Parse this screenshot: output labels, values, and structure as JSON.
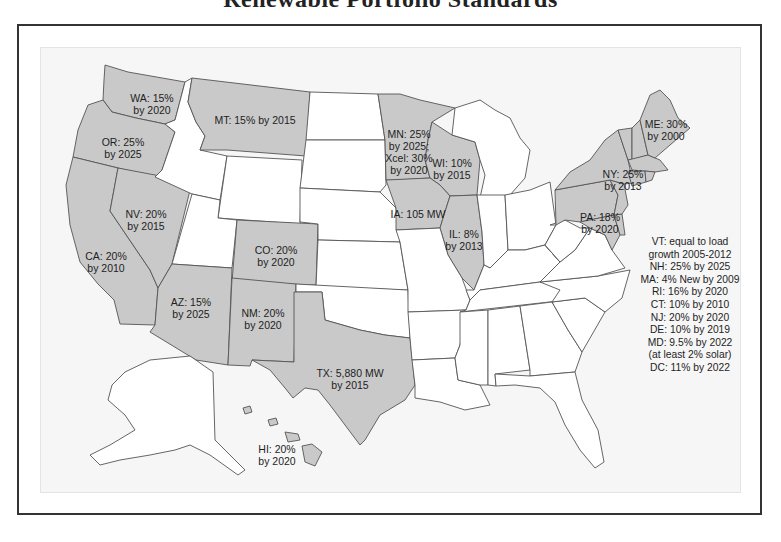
{
  "title": "Renewable Portfolio Standards",
  "colors": {
    "rps_state_fill": "#c9c9c9",
    "no_rps_state_fill": "#ffffff",
    "background": "#f6f6f6",
    "border": "#555555"
  },
  "state_labels": {
    "WA": {
      "line1": "WA: 15%",
      "line2": "by 2020"
    },
    "OR": {
      "line1": "OR: 25%",
      "line2": "by 2025"
    },
    "MT": {
      "line1": "MT: 15% by 2015",
      "line2": ""
    },
    "NV": {
      "line1": "NV: 20%",
      "line2": "by 2015"
    },
    "CA": {
      "line1": "CA: 20%",
      "line2": "by 2010"
    },
    "CO": {
      "line1": "CO: 20%",
      "line2": "by 2020"
    },
    "AZ": {
      "line1": "AZ: 15%",
      "line2": "by 2025"
    },
    "NM": {
      "line1": "NM: 20%",
      "line2": "by 2020"
    },
    "TX": {
      "line1": "TX: 5,880 MW",
      "line2": "by 2015"
    },
    "MN": {
      "line1": "MN: 25%",
      "line2": "by 2025;",
      "line3": "Xcel: 30%",
      "line4": "by 2020"
    },
    "WI": {
      "line1": "WI: 10%",
      "line2": "by 2015"
    },
    "IA": {
      "line1": "IA: 105 MW",
      "line2": ""
    },
    "IL": {
      "line1": "IL: 8%",
      "line2": "by 2013"
    },
    "ME": {
      "line1": "ME: 30%",
      "line2": "by 2000"
    },
    "NY": {
      "line1": "NY: 25%",
      "line2": "by 2013"
    },
    "PA": {
      "line1": "PA: 18%",
      "line2": "by 2020"
    },
    "HI": {
      "line1": "HI: 20%",
      "line2": "by 2020"
    }
  },
  "northeast_legend": [
    "VT: equal to load",
    "growth 2005-2012",
    "NH: 25% by 2025",
    "MA: 4% New by 2009",
    "RI: 16% by 2020",
    "CT: 10% by 2010",
    "NJ: 20% by 2020",
    "DE: 10% by 2019",
    "MD: 9.5% by 2022",
    "(at least 2% solar)",
    "DC: 11% by 2022"
  ],
  "rps_states": [
    "WA",
    "OR",
    "CA",
    "NV",
    "MT",
    "CO",
    "AZ",
    "NM",
    "TX",
    "MN",
    "WI",
    "IA",
    "IL",
    "NY",
    "PA",
    "ME",
    "VT",
    "NH",
    "MA",
    "RI",
    "CT",
    "NJ",
    "DE",
    "MD",
    "DC",
    "HI"
  ],
  "non_rps_states": [
    "ID",
    "WY",
    "UT",
    "ND",
    "SD",
    "NE",
    "KS",
    "OK",
    "MO",
    "AR",
    "LA",
    "MI",
    "IN",
    "OH",
    "KY",
    "TN",
    "MS",
    "AL",
    "GA",
    "FL",
    "SC",
    "NC",
    "VA",
    "WV",
    "AK"
  ]
}
